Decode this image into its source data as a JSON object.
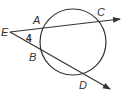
{
  "diagram": {
    "type": "circle-with-two-secants",
    "colors": {
      "stroke": "#333333",
      "background": "#ffffff"
    },
    "circle": {
      "cx": 73,
      "cy": 42,
      "r": 33
    },
    "points": {
      "E": {
        "label": "E",
        "x": 10,
        "y": 32
      },
      "A": {
        "label": "A",
        "x": 41,
        "y": 28
      },
      "C": {
        "label": "C",
        "x": 103,
        "y": 21
      },
      "B": {
        "label": "B",
        "x": 40,
        "y": 48
      },
      "D": {
        "label": "D",
        "x": 85,
        "y": 74
      }
    },
    "angle_label": "4",
    "secants": [
      {
        "name": "ray-EC",
        "from": "E",
        "through": [
          "A",
          "C"
        ]
      },
      {
        "name": "ray-ED",
        "from": "E",
        "through": [
          "B",
          "D"
        ]
      }
    ]
  }
}
